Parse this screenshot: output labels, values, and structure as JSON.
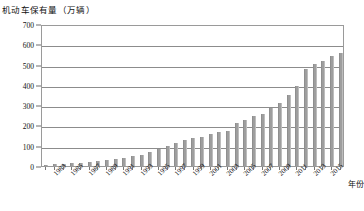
{
  "chart_data": {
    "type": "bar",
    "title": "机动车保有量（万辆）",
    "ylabel": "机动车保有量（万辆）",
    "xlabel": "年份",
    "ylim": [
      0,
      700
    ],
    "ytick_step": 100,
    "yticks": [
      0,
      100,
      200,
      300,
      400,
      500,
      600,
      700
    ],
    "ytick_labels": [
      "0",
      "100",
      "200",
      "300",
      "400",
      "500",
      "600",
      "700"
    ],
    "grid": true,
    "legend": "none",
    "categories": [
      "1982",
      "1983",
      "1984",
      "1985",
      "1986",
      "1987",
      "1988",
      "1989",
      "1990",
      "1991",
      "1992",
      "1993",
      "1994",
      "1995",
      "1996",
      "1997",
      "1998",
      "1999",
      "2000",
      "2001",
      "2002",
      "2003",
      "2004",
      "2005",
      "2006",
      "2007",
      "2008",
      "2009",
      "2010",
      "2011",
      "2012",
      "2013",
      "2014",
      "2015",
      "2016"
    ],
    "values": [
      7,
      9,
      11,
      13,
      16,
      19,
      23,
      28,
      33,
      39,
      47,
      55,
      67,
      82,
      98,
      112,
      127,
      137,
      145,
      158,
      168,
      175,
      211,
      229,
      245,
      257,
      285,
      312,
      348,
      396,
      480,
      502,
      518,
      540,
      555
    ],
    "xtick_labels": [
      "1983",
      "1985",
      "1987",
      "1989",
      "1991",
      "1993",
      "1995",
      "1997",
      "1999",
      "2001",
      "2003",
      "2005",
      "2007",
      "2009",
      "2011",
      "2013",
      "2015"
    ],
    "xtick_categories": [
      "1983",
      "1985",
      "1987",
      "1989",
      "1991",
      "1993",
      "1995",
      "1997",
      "1999",
      "2001",
      "2003",
      "2005",
      "2007",
      "2009",
      "2011",
      "2013",
      "2015"
    ],
    "bar_color": "#9e9e9e",
    "axis_color": "#8c8c8c",
    "unit_note": "万辆"
  }
}
